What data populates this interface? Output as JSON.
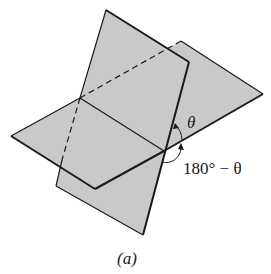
{
  "diagram": {
    "caption": "(a)",
    "angle_labels": {
      "theta": "θ",
      "supplement": "180° − θ"
    },
    "colors": {
      "plane_fill": "#c9c9c9",
      "edge": "#1a1a1a",
      "background": "#ffffff"
    }
  }
}
